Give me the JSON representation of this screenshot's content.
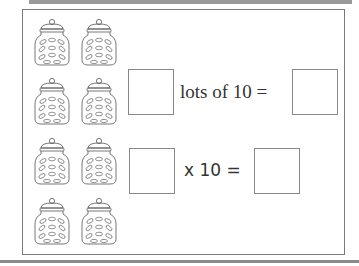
{
  "worksheet": {
    "jar_count": 8,
    "jar_icon": "cookie-jar-icon",
    "row1": {
      "text": "lots of 10 ="
    },
    "row2": {
      "text": "x 10 ="
    }
  },
  "colors": {
    "frame": "#7a7a7a",
    "bar": "#9a9a9a",
    "ink": "#333333"
  }
}
